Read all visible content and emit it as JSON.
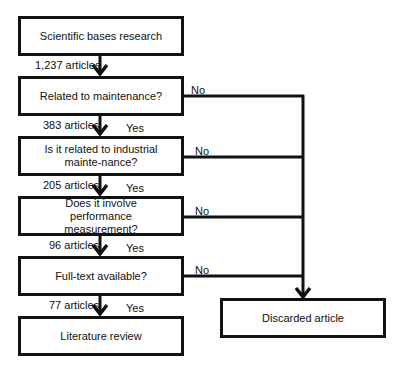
{
  "diagram": {
    "type": "flowchart",
    "steps": [
      {
        "id": "step-1",
        "text": "Scientific bases research"
      },
      {
        "id": "step-2",
        "text": "Related to maintenance?"
      },
      {
        "id": "step-3",
        "text": "Is it related to industrial mainte-nance?"
      },
      {
        "id": "step-4",
        "text": "Does it involve performance measurement?"
      },
      {
        "id": "step-5",
        "text": "Full-text available?"
      },
      {
        "id": "step-6",
        "text": "Literature review"
      }
    ],
    "counts": [
      "1,237 articles",
      "383 articles",
      "205 articles",
      "96 articles",
      "77 articles"
    ],
    "yes_label": "Yes",
    "no_label": "No",
    "discarded": {
      "text": "Discarded article"
    },
    "colors": {
      "stroke": "#111111",
      "background": "#ffffff"
    }
  }
}
